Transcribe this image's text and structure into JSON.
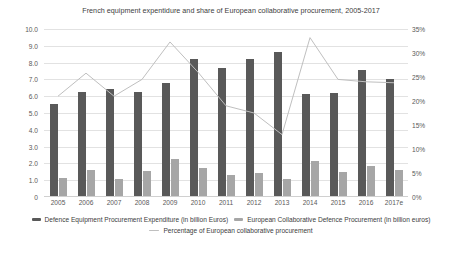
{
  "chart_data": {
    "type": "bar",
    "title": "French equipment expentidure and share of European collaborative procurement, 2005-2017",
    "xlabel": "",
    "ylabel": "",
    "categories": [
      "2005",
      "2006",
      "2007",
      "2008",
      "2009",
      "2010",
      "2011",
      "2012",
      "2013",
      "2014",
      "2015",
      "2016",
      "2017e"
    ],
    "ylim": [
      0,
      10
    ],
    "y_ticks": [
      "0",
      "1.0",
      "2.0",
      "3.0",
      "4.0",
      "5.0",
      "6.0",
      "7.0",
      "8.0",
      "9.0",
      "10.0"
    ],
    "y2lim": [
      0,
      35
    ],
    "y2_ticks": [
      "0%",
      "5%",
      "10%",
      "15%",
      "20%",
      "25%",
      "30%",
      "35%"
    ],
    "grid": true,
    "legend_position": "bottom",
    "series": [
      {
        "name": "Defence Equipment Procurement Expenditure (in billion Euros)",
        "type": "bar",
        "axis": "left",
        "color": "#595959",
        "values": [
          5.55,
          6.25,
          6.4,
          6.25,
          6.8,
          8.2,
          7.7,
          8.2,
          8.65,
          6.15,
          6.2,
          7.55,
          7.0
        ]
      },
      {
        "name": "European Collaborative Defence Procurement (in billion euros)",
        "type": "bar",
        "axis": "left",
        "color": "#a6a6a6",
        "values": [
          1.15,
          1.6,
          1.1,
          1.55,
          2.25,
          1.7,
          1.3,
          1.4,
          1.1,
          2.15,
          1.5,
          1.85,
          1.6
        ]
      },
      {
        "name": "Percentage of European collaborative procurement",
        "type": "line",
        "axis": "right",
        "color": "#bfbfbf",
        "values": [
          21.0,
          25.8,
          21.0,
          24.5,
          32.3,
          26.0,
          19.0,
          17.5,
          13.0,
          33.2,
          24.5,
          24.0,
          23.8
        ]
      }
    ]
  }
}
